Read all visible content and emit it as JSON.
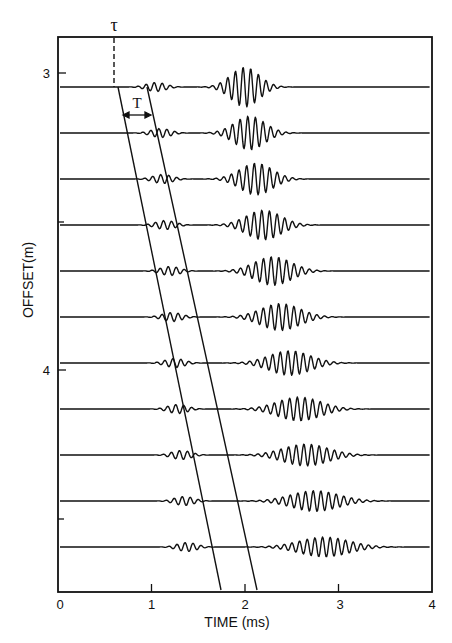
{
  "chart_data": {
    "type": "line",
    "title": "",
    "xlabel": "TIME (ms)",
    "ylabel": "OFFSET(m)",
    "xlim": [
      0,
      4
    ],
    "ylim_inverted": [
      2.88,
      4.75
    ],
    "x_ticks": [
      0,
      1,
      2,
      3,
      4
    ],
    "x_tick_labels": [
      "0",
      "1",
      "2",
      "3",
      "4"
    ],
    "y_major_ticks": [
      3,
      4
    ],
    "y_tick_labels": [
      "3",
      "4"
    ],
    "y_minor_ticks": [
      3.5,
      4.5
    ],
    "grid": false,
    "legend": null,
    "traces": [
      {
        "offset_m": 3.05,
        "precursor_center_ms": 1.05,
        "main_center_ms": 2.0,
        "main_amplitude": 1.0
      },
      {
        "offset_m": 3.2,
        "precursor_center_ms": 1.1,
        "main_center_ms": 2.05,
        "main_amplitude": 0.85
      },
      {
        "offset_m": 3.36,
        "precursor_center_ms": 1.12,
        "main_center_ms": 2.12,
        "main_amplitude": 0.8
      },
      {
        "offset_m": 3.51,
        "precursor_center_ms": 1.15,
        "main_center_ms": 2.2,
        "main_amplitude": 0.75
      },
      {
        "offset_m": 3.67,
        "precursor_center_ms": 1.2,
        "main_center_ms": 2.3,
        "main_amplitude": 0.72
      },
      {
        "offset_m": 3.82,
        "precursor_center_ms": 1.22,
        "main_center_ms": 2.38,
        "main_amplitude": 0.68
      },
      {
        "offset_m": 3.98,
        "precursor_center_ms": 1.25,
        "main_center_ms": 2.48,
        "main_amplitude": 0.62
      },
      {
        "offset_m": 4.13,
        "precursor_center_ms": 1.28,
        "main_center_ms": 2.58,
        "main_amplitude": 0.6
      },
      {
        "offset_m": 4.29,
        "precursor_center_ms": 1.32,
        "main_center_ms": 2.65,
        "main_amplitude": 0.55
      },
      {
        "offset_m": 4.44,
        "precursor_center_ms": 1.35,
        "main_center_ms": 2.75,
        "main_amplitude": 0.52
      },
      {
        "offset_m": 4.6,
        "precursor_center_ms": 1.38,
        "main_center_ms": 2.85,
        "main_amplitude": 0.5
      }
    ],
    "moveout_lines": [
      {
        "name": "line-1",
        "start": {
          "time_ms": 0.6,
          "offset_m": 3.05
        },
        "end": {
          "time_ms": 1.75,
          "offset_m": 4.75
        }
      },
      {
        "name": "line-2",
        "start": {
          "time_ms": 0.95,
          "offset_m": 3.05
        },
        "end": {
          "time_ms": 2.12,
          "offset_m": 4.75
        }
      }
    ],
    "annotations": [
      {
        "text": "τ",
        "meaning": "intercept time (dashed vertical line at ~0.6 ms)"
      },
      {
        "text": "T",
        "meaning": "time interval between the two moveout lines (double arrow)"
      }
    ]
  },
  "labels": {
    "x_axis_title": "TIME (ms)",
    "y_axis_title": "OFFSET(m)",
    "x_ticks": [
      "0",
      "1",
      "2",
      "3",
      "4"
    ],
    "y_ticks": [
      "3",
      "4"
    ],
    "tau": "τ",
    "interval": "T"
  },
  "style": {
    "ink": "#111111",
    "background": "#ffffff"
  }
}
